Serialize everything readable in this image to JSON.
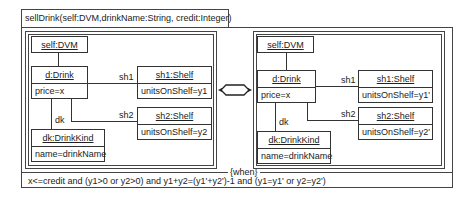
{
  "operation": {
    "signature": "sellDrink(self:DVM,drinkName:String, credit:Integer)",
    "when_label": "{when}",
    "condition": "x<=credit and (y1>0 or y2>0) and y1+y2=(y1'+y2')-1 and  (y1=y1' or y2=y2')"
  },
  "left": {
    "self": "self:DVM",
    "drink": {
      "name": "d:Drink",
      "attr": "price=x"
    },
    "sh1": {
      "name": "sh1:Shelf",
      "attr": "unitsOnShelf=y1",
      "role": "sh1"
    },
    "sh2": {
      "name": "sh2:Shelf",
      "attr": "unitsOnShelf=y2",
      "role": "sh2"
    },
    "kind": {
      "name": "dk:DrinkKind",
      "attr": "name=drinkName",
      "role": "dk"
    }
  },
  "right": {
    "self": "self:DVM",
    "drink": {
      "name": "d:Drink",
      "attr": "price=x"
    },
    "sh1": {
      "name": "sh1:Shelf",
      "attr": "unitsOnShelf=y1'",
      "role": "sh1"
    },
    "sh2": {
      "name": "sh2:Shelf",
      "attr": "unitsOnShelf=y2'",
      "role": "sh2"
    },
    "kind": {
      "name": "dk:DrinkKind",
      "attr": "name=drinkName",
      "role": "dk"
    }
  },
  "transition_icon": "double-arrow-hexagon-icon"
}
